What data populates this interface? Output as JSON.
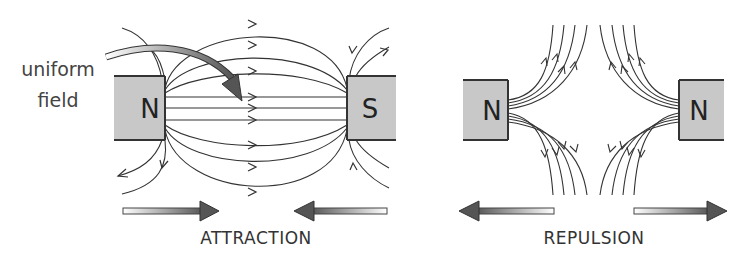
{
  "diagram": {
    "attraction": {
      "caption": "ATTRACTION",
      "left_magnet": {
        "pole": "N"
      },
      "right_magnet": {
        "pole": "S"
      },
      "annotation": {
        "line1": "uniform",
        "line2": "field"
      },
      "force_arrows": [
        "right",
        "left"
      ]
    },
    "repulsion": {
      "caption": "REPULSION",
      "left_magnet": {
        "pole": "N"
      },
      "right_magnet": {
        "pole": "N"
      },
      "force_arrows": [
        "left",
        "right"
      ]
    },
    "colors": {
      "magnet_fill": "#c8c8c8",
      "magnet_edge": "#333333",
      "field_line": "#333333",
      "arrow_dark": "#555555",
      "arrow_light": "#ffffff"
    }
  }
}
